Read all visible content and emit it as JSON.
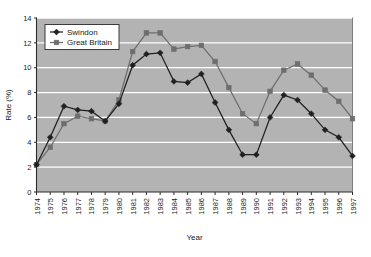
{
  "chart_data": {
    "type": "line",
    "title": "",
    "xlabel": "Year",
    "ylabel": "Rate (%)",
    "xlim": [
      1974,
      1997
    ],
    "ylim": [
      0,
      14
    ],
    "ytick_labels": [
      "0",
      "2",
      "4",
      "6",
      "8",
      "10",
      "12",
      "14"
    ],
    "yticks": [
      0,
      2,
      4,
      6,
      8,
      10,
      12,
      14
    ],
    "grid": true,
    "grid_color": "#ffffff",
    "plot_background": "#b3b3b3",
    "legend_position": "upper-left",
    "categories": [
      1974,
      1975,
      1976,
      1977,
      1978,
      1979,
      1980,
      1981,
      1982,
      1983,
      1984,
      1985,
      1986,
      1987,
      1988,
      1989,
      1990,
      1991,
      1992,
      1993,
      1994,
      1995,
      1996,
      1997
    ],
    "xtick_labels": [
      "1974",
      "1975",
      "1976",
      "1977",
      "1978",
      "1979",
      "1980",
      "1981",
      "1982",
      "1983",
      "1984",
      "1985",
      "1986",
      "1987",
      "1988",
      "1989",
      "1990",
      "1991",
      "1992",
      "1993",
      "1994",
      "1995",
      "1996",
      "1997"
    ],
    "series": [
      {
        "name": "Swindon",
        "color": "#231f20",
        "marker": "diamond",
        "values": [
          2.2,
          4.4,
          6.9,
          6.6,
          6.5,
          5.7,
          7.1,
          10.2,
          11.1,
          11.2,
          8.9,
          8.8,
          9.5,
          7.2,
          5.0,
          3.0,
          3.0,
          6.0,
          7.8,
          7.4,
          6.3,
          5.0,
          4.4,
          2.9
        ]
      },
      {
        "name": "Great Britain",
        "color": "#6e6e6e",
        "marker": "square",
        "values": [
          2.2,
          3.6,
          5.5,
          6.1,
          5.9,
          5.7,
          7.4,
          11.3,
          12.8,
          12.8,
          11.5,
          11.7,
          11.8,
          10.5,
          8.4,
          6.3,
          5.5,
          8.1,
          9.8,
          10.3,
          9.4,
          8.2,
          7.3,
          5.9
        ]
      }
    ]
  },
  "legend": {
    "items": [
      {
        "label": "Swindon"
      },
      {
        "label": "Great Britain"
      }
    ]
  },
  "axes": {
    "x_title": "Year",
    "y_title": "Rate (%)"
  }
}
